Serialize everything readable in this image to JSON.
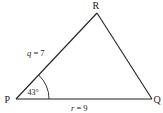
{
  "diagram": {
    "type": "triangle",
    "stroke_color": "#222222",
    "background": "#ffffff",
    "vertices": {
      "P": {
        "label": "P",
        "x": 16,
        "y": 99
      },
      "Q": {
        "label": "Q",
        "x": 152,
        "y": 99
      },
      "R": {
        "label": "R",
        "x": 97,
        "y": 13
      }
    },
    "sides": {
      "q": {
        "var": "q",
        "eq": " = 7",
        "value": 7,
        "between": [
          "P",
          "R"
        ]
      },
      "r": {
        "var": "r",
        "eq": " = 9",
        "value": 9,
        "between": [
          "P",
          "Q"
        ]
      }
    },
    "angle": {
      "vertex": "P",
      "label": "43°",
      "degrees": 43
    }
  }
}
